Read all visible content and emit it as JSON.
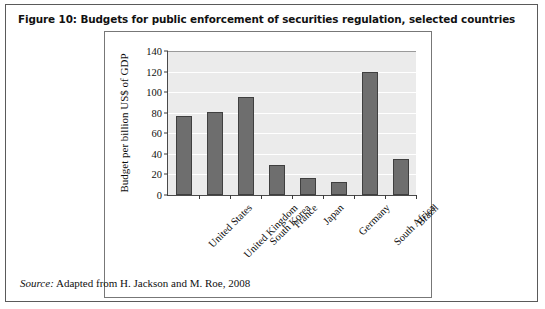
{
  "figure": {
    "caption": "Figure 10: Budgets for public enforcement of securities regulation, selected countries",
    "source_label": "Source:",
    "source_text": " Adapted from H. Jackson and M. Roe, 2008"
  },
  "colors": {
    "bar_fill": "#6e6e6e",
    "bar_stroke": "#3f3f3f",
    "plot_background": "#ebebeb",
    "gridline": "#ffffff",
    "axis": "#4a4a4a",
    "frame": "#5a5a5a"
  },
  "chart_data": {
    "type": "bar",
    "title": "Figure 10: Budgets for public enforcement of securities regulation, selected countries",
    "categories": [
      "United States",
      "United Kingdom",
      "South Korea",
      "France",
      "Japan",
      "Germany",
      "South Africa",
      "Brazil"
    ],
    "values": [
      77,
      81,
      95,
      29,
      17,
      13,
      120,
      35
    ],
    "xlabel": "",
    "ylabel": "Budget per billion US$ of GDP",
    "ylim": [
      0,
      140
    ],
    "yticks": [
      0,
      20,
      40,
      60,
      80,
      100,
      120,
      140
    ],
    "ytick_labels": [
      "0",
      "20",
      "40",
      "60",
      "80",
      "100",
      "120",
      "140"
    ],
    "grid": true,
    "legend": false,
    "annotations": [
      "Source: Adapted from H. Jackson and M. Roe, 2008"
    ]
  }
}
